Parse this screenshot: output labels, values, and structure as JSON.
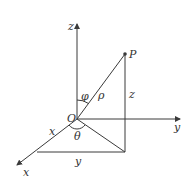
{
  "diagram": {
    "type": "spherical-coordinates",
    "labels": {
      "z_axis": "z",
      "y_axis": "y",
      "x_axis": "x",
      "origin": "O",
      "point": "P",
      "phi": "φ",
      "rho": "ρ",
      "theta": "θ",
      "x_segment": "x",
      "y_segment": "y",
      "z_segment": "z"
    },
    "colors": {
      "line": "#3a3a3a",
      "text": "#333333"
    }
  }
}
